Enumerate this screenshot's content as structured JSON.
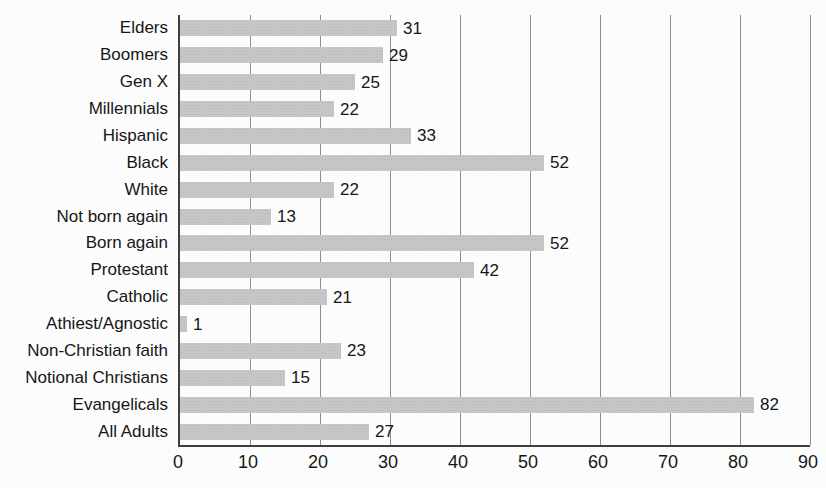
{
  "chart_data": {
    "type": "bar",
    "orientation": "horizontal",
    "title": "",
    "xlabel": "",
    "ylabel": "",
    "categories": [
      "Elders",
      "Boomers",
      "Gen X",
      "Millennials",
      "Hispanic",
      "Black",
      "White",
      "Not born again",
      "Born again",
      "Protestant",
      "Catholic",
      "Athiest/Agnostic",
      "Non-Christian faith",
      "Notional Christians",
      "Evangelicals",
      "All Adults"
    ],
    "values": [
      31,
      29,
      25,
      22,
      33,
      52,
      22,
      13,
      52,
      42,
      21,
      1,
      23,
      15,
      82,
      27
    ],
    "xlim": [
      0,
      90
    ],
    "xticks": [
      0,
      10,
      20,
      30,
      40,
      50,
      60,
      70,
      80,
      90
    ],
    "grid": "vertical",
    "legend": "none",
    "value_labels": true
  },
  "colors": {
    "bar": "#c6c6c6",
    "bar_dot": "#b9b9b9",
    "gridline": "#8e8e8e",
    "axis": "#3f3f3f",
    "text": "#161616",
    "background": "#fcfcfc"
  }
}
